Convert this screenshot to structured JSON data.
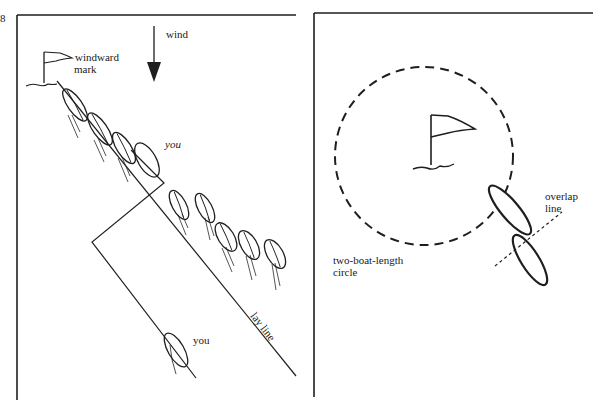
{
  "figure_number": "8",
  "left_panel": {
    "labels": {
      "wind": "wind",
      "windward_mark_line1": "windward",
      "windward_mark_line2": "mark",
      "you_top": "you",
      "you_bottom": "you",
      "lay_line": "lay line"
    },
    "icons": [
      "flag-icon",
      "wind-arrow-icon",
      "boat-icon"
    ],
    "boat_count_in_line": 10
  },
  "right_panel": {
    "labels": {
      "overlap_line1": "overlap",
      "overlap_line2": "line",
      "circle_line1": "two-boat-length",
      "circle_line2": "circle"
    },
    "icons": [
      "flag-icon",
      "boat-icon"
    ],
    "boat_count": 2
  },
  "colors": {
    "ink": "#1e1e1e",
    "background": "#ffffff"
  }
}
